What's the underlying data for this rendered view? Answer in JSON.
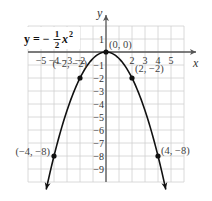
{
  "chart_data": {
    "type": "line",
    "equation": {
      "lhs": "y",
      "sign": "= −",
      "num": "1",
      "den": "2",
      "var": "x",
      "exp": "2"
    },
    "xlabel": "x",
    "ylabel": "y",
    "xlim": [
      -6,
      6
    ],
    "ylim": [
      -10,
      2
    ],
    "grid": true,
    "x_ticks": [
      -5,
      -4,
      -3,
      -2,
      2,
      3,
      4,
      5
    ],
    "x_tick_labels": [
      "−5",
      "−4",
      "−3",
      "−2",
      "2",
      "3",
      "4",
      "5"
    ],
    "y_ticks": [
      1,
      -1,
      -2,
      -3,
      -4,
      -5,
      -6,
      -7,
      -8,
      -9
    ],
    "y_tick_labels": [
      "1",
      "−1",
      "−2",
      "−3",
      "−4",
      "−5",
      "−6",
      "−7",
      "−8",
      "−9"
    ],
    "series": [
      {
        "name": "y = -1/2 x^2",
        "function": "-0.5*x^2",
        "x_range": [
          -4.6,
          4.6
        ]
      }
    ],
    "points": [
      {
        "x": -4,
        "y": -8,
        "label": "(−4, −8)"
      },
      {
        "x": -2,
        "y": -2,
        "label": "(−2, −2)"
      },
      {
        "x": 0,
        "y": 0,
        "label": "(0, 0)"
      },
      {
        "x": 2,
        "y": -2,
        "label": "(2, −2)"
      },
      {
        "x": 4,
        "y": -8,
        "label": "(4, −8)"
      }
    ]
  },
  "colors": {
    "grid": "#d0d0d0",
    "axis": "#555555",
    "curve": "#111111"
  }
}
